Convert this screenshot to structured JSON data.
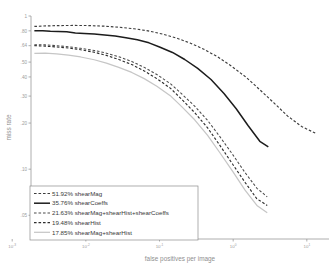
{
  "chart_data": {
    "type": "line",
    "title": "",
    "xlabel": "false positives per image",
    "ylabel": "miss rate",
    "xscale": "log",
    "yscale": "log",
    "xlim": [
      0.0018,
      20
    ],
    "ylim": [
      0.035,
      1.0
    ],
    "grid": false,
    "legend_position": "lower-left",
    "xticks": [
      0.001,
      0.01,
      0.1,
      1,
      10
    ],
    "xticklabels": [
      "10^-3",
      "10^-2",
      "10^-1",
      "10^0",
      "10^1"
    ],
    "yticks": [
      1.0,
      0.8,
      0.64,
      0.5,
      0.4,
      0.3,
      0.2,
      0.1,
      0.05
    ],
    "yticklabels": [
      "1",
      ".80",
      ".64",
      ".50",
      ".40",
      ".30",
      ".20",
      ".10",
      ".05"
    ],
    "series": [
      {
        "name": "shearMag",
        "score": "51.92%",
        "legend_label": "51.92% shearMag",
        "style": "dashed",
        "color": "#3c3c3c",
        "width": 1.15,
        "x": [
          0.002,
          0.003,
          0.0045,
          0.007,
          0.011,
          0.018,
          0.028,
          0.045,
          0.07,
          0.11,
          0.17,
          0.26,
          0.4,
          0.62,
          0.95,
          1.5,
          2.3,
          3.6,
          5.5,
          8.5,
          13.0
        ],
        "y": [
          0.855,
          0.862,
          0.866,
          0.868,
          0.866,
          0.858,
          0.845,
          0.826,
          0.8,
          0.762,
          0.718,
          0.666,
          0.607,
          0.54,
          0.47,
          0.398,
          0.33,
          0.27,
          0.222,
          0.19,
          0.172
        ]
      },
      {
        "name": "shearCoeffs",
        "score": "35.76%",
        "legend_label": "35.76% shearCoeffs",
        "style": "solid",
        "color": "#1c1c1c",
        "width": 1.5,
        "x": [
          0.002,
          0.0026,
          0.0033,
          0.0042,
          0.0055,
          0.0072,
          0.0095,
          0.013,
          0.018,
          0.025,
          0.035,
          0.05,
          0.072,
          0.1,
          0.15,
          0.22,
          0.33,
          0.5,
          0.75,
          1.1,
          1.6,
          2.3,
          3.0
        ],
        "y": [
          0.8,
          0.8,
          0.795,
          0.793,
          0.79,
          0.775,
          0.77,
          0.762,
          0.752,
          0.74,
          0.722,
          0.7,
          0.668,
          0.628,
          0.578,
          0.52,
          0.455,
          0.385,
          0.312,
          0.248,
          0.192,
          0.152,
          0.14
        ]
      },
      {
        "name": "shearMag+shearHist+shearCoeffs",
        "score": "21.63%",
        "legend_label": "21.63% shearMag+shearHist+shearCoeffs",
        "style": "dashed",
        "color": "#4a4a4a",
        "width": 1.05,
        "x": [
          0.002,
          0.0028,
          0.004,
          0.0058,
          0.0085,
          0.013,
          0.019,
          0.028,
          0.042,
          0.062,
          0.092,
          0.14,
          0.2,
          0.3,
          0.45,
          0.66,
          0.98,
          1.45,
          2.1,
          2.9
        ],
        "y": [
          0.65,
          0.648,
          0.64,
          0.63,
          0.615,
          0.596,
          0.572,
          0.542,
          0.505,
          0.462,
          0.415,
          0.362,
          0.31,
          0.258,
          0.208,
          0.163,
          0.125,
          0.095,
          0.075,
          0.066
        ]
      },
      {
        "name": "shearHist",
        "score": "19.48%",
        "legend_label": "19.48% shearHist",
        "style": "dashed",
        "color": "#2e2e2e",
        "width": 1.15,
        "x": [
          0.002,
          0.0028,
          0.004,
          0.0058,
          0.0085,
          0.013,
          0.019,
          0.028,
          0.042,
          0.062,
          0.092,
          0.14,
          0.2,
          0.3,
          0.45,
          0.66,
          0.98,
          1.45,
          2.1,
          2.9
        ],
        "y": [
          0.64,
          0.636,
          0.628,
          0.618,
          0.602,
          0.58,
          0.553,
          0.52,
          0.482,
          0.438,
          0.39,
          0.338,
          0.286,
          0.234,
          0.186,
          0.143,
          0.108,
          0.082,
          0.064,
          0.058
        ]
      },
      {
        "name": "shearMag+shearHist",
        "score": "17.85%",
        "legend_label": "17.85% shearMag+shearHist",
        "style": "solid",
        "color": "#c6c6c6",
        "width": 1.25,
        "x": [
          0.002,
          0.0028,
          0.004,
          0.0058,
          0.0085,
          0.013,
          0.019,
          0.028,
          0.042,
          0.062,
          0.092,
          0.14,
          0.2,
          0.3,
          0.45,
          0.66,
          0.98,
          1.45,
          2.1,
          2.9
        ],
        "y": [
          0.57,
          0.572,
          0.566,
          0.556,
          0.54,
          0.518,
          0.492,
          0.462,
          0.428,
          0.39,
          0.348,
          0.302,
          0.256,
          0.21,
          0.166,
          0.128,
          0.097,
          0.073,
          0.058,
          0.052
        ]
      }
    ]
  },
  "legend": {
    "entries": [
      "51.92% shearMag",
      "35.76% shearCoeffs",
      "21.63% shearMag+shearHist+shearCoeffs",
      "19.48% shearHist",
      "17.85% shearMag+shearHist"
    ]
  },
  "axes": {
    "xlabel": "false positives per image",
    "ylabel": "miss rate"
  }
}
